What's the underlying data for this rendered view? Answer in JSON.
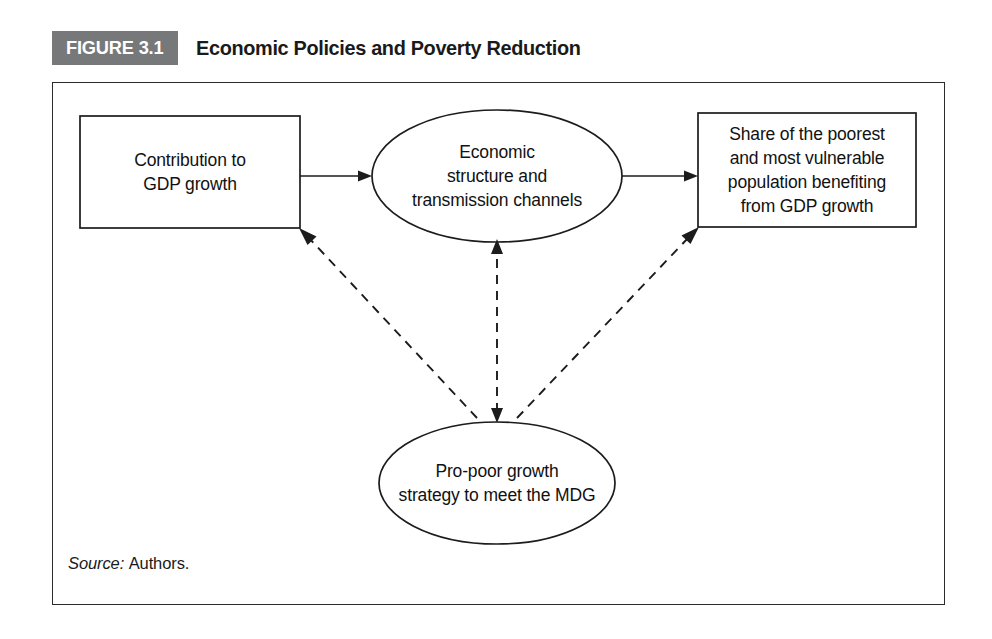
{
  "figure": {
    "badge_label": "FIGURE 3.1",
    "title": "Economic Policies and Poverty Reduction",
    "badge_bg_color": "#77787a",
    "badge_text_color": "#ffffff",
    "frame_border_color": "#2b2b2b",
    "stroke_color": "#1c1c1c"
  },
  "nodes": {
    "contribution": {
      "shape": "rectangle",
      "text": "Contribution to\nGDP growth"
    },
    "structure": {
      "shape": "ellipse",
      "text": "Economic\nstructure and\ntransmission channels"
    },
    "share": {
      "shape": "rectangle",
      "text": "Share of the poorest\nand most vulnerable\npopulation benefiting\nfrom GDP growth"
    },
    "propoor": {
      "shape": "ellipse",
      "text": "Pro-poor growth\nstrategy to meet the MDG"
    }
  },
  "connectors": [
    {
      "id": "contribution-to-structure",
      "style": "solid",
      "from": "contribution",
      "to": "structure",
      "direction": "forward"
    },
    {
      "id": "structure-to-share",
      "style": "solid",
      "from": "structure",
      "to": "share",
      "direction": "forward"
    },
    {
      "id": "propoor-to-contribution",
      "style": "dashed",
      "from": "propoor",
      "to": "contribution",
      "direction": "forward"
    },
    {
      "id": "propoor-to-structure",
      "style": "dashed",
      "from": "propoor",
      "to": "structure",
      "direction": "both"
    },
    {
      "id": "propoor-to-share",
      "style": "dashed",
      "from": "propoor",
      "to": "share",
      "direction": "forward"
    }
  ],
  "source": {
    "label": "Source:",
    "value": "Authors."
  }
}
